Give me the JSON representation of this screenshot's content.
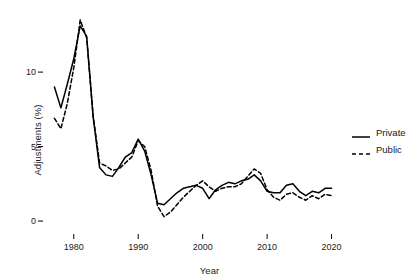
{
  "chart_data": {
    "type": "line",
    "title": "",
    "subtitle": "",
    "xlabel": "Year",
    "ylabel": "Adjustments (%)",
    "xlim": [
      1976,
      2021
    ],
    "ylim": [
      -0.6,
      13.9
    ],
    "grid": false,
    "legend_position": "right",
    "xticks": [
      1980,
      1990,
      2000,
      2010,
      2020
    ],
    "xtick_labels": [
      "1980",
      "1990",
      "2000",
      "2010",
      "2020"
    ],
    "yticks": [
      0,
      5,
      10
    ],
    "ytick_labels": [
      "0",
      "5",
      "10"
    ],
    "x": [
      1977,
      1978,
      1979,
      1980,
      1981,
      1982,
      1983,
      1984,
      1985,
      1986,
      1987,
      1988,
      1989,
      1990,
      1991,
      1992,
      1993,
      1994,
      1995,
      1996,
      1997,
      1998,
      1999,
      2000,
      2001,
      2002,
      2003,
      2004,
      2005,
      2006,
      2007,
      2008,
      2009,
      2010,
      2011,
      2012,
      2013,
      2014,
      2015,
      2016,
      2017,
      2018,
      2019,
      2020
    ],
    "series": [
      {
        "name": "Private",
        "style": "solid",
        "color": "#000000",
        "values": [
          9.0,
          7.6,
          9.2,
          10.9,
          13.1,
          12.4,
          7.0,
          3.6,
          3.1,
          3.0,
          3.6,
          4.3,
          4.6,
          5.5,
          4.7,
          3.1,
          1.2,
          1.1,
          1.5,
          1.9,
          2.2,
          2.3,
          2.4,
          2.2,
          1.5,
          2.1,
          2.4,
          2.6,
          2.5,
          2.7,
          2.8,
          3.1,
          2.7,
          2.0,
          1.9,
          1.9,
          2.4,
          2.5,
          2.0,
          1.7,
          2.0,
          1.9,
          2.2,
          2.2
        ],
        "marker": "none"
      },
      {
        "name": "Public",
        "style": "dashed",
        "color": "#000000",
        "values": [
          6.9,
          6.2,
          7.9,
          10.3,
          13.5,
          12.3,
          7.1,
          3.9,
          3.7,
          3.4,
          3.5,
          3.9,
          4.3,
          5.4,
          5.0,
          3.4,
          1.0,
          0.3,
          0.6,
          1.1,
          1.6,
          2.0,
          2.4,
          2.7,
          2.3,
          2.0,
          2.2,
          2.3,
          2.3,
          2.5,
          3.0,
          3.5,
          3.2,
          2.1,
          1.6,
          1.4,
          1.8,
          1.9,
          1.6,
          1.4,
          1.7,
          1.5,
          1.8,
          1.7
        ],
        "marker": "none"
      }
    ]
  },
  "legend": {
    "items": [
      {
        "label": "Private",
        "style": "solid"
      },
      {
        "label": "Public",
        "style": "dashed"
      }
    ]
  }
}
